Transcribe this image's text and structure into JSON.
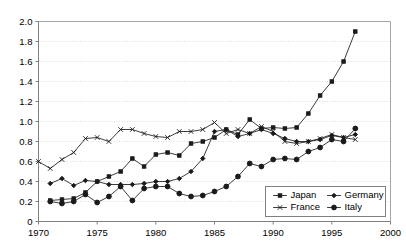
{
  "chart_data": {
    "type": "line",
    "title": "",
    "subtitle": "",
    "xlabel": "",
    "ylabel": "",
    "xlim": [
      1970,
      2000
    ],
    "ylim": [
      0,
      2.0
    ],
    "xticks": [
      "1970",
      "1975",
      "1980",
      "1985",
      "1990",
      "1995",
      "2000"
    ],
    "xtick_values": [
      1970,
      1975,
      1980,
      1985,
      1990,
      1995,
      2000
    ],
    "yticks": [
      "0",
      "0.2",
      "0.4",
      "0.6",
      "0.8",
      "1.0",
      "1.2",
      "1.4",
      "1.6",
      "1.8",
      "2.0"
    ],
    "ytick_values": [
      0,
      0.2,
      0.4,
      0.6,
      0.8,
      1.0,
      1.2,
      1.4,
      1.6,
      1.8,
      2.0
    ],
    "grid": true,
    "grid_axis": "y",
    "legend_position": "bottom-right",
    "series": [
      {
        "name": "Japan",
        "marker": "square",
        "x": [
          1971,
          1972,
          1973,
          1974,
          1975,
          1976,
          1977,
          1978,
          1979,
          1980,
          1981,
          1982,
          1983,
          1984,
          1985,
          1986,
          1987,
          1988,
          1989,
          1990,
          1991,
          1992,
          1993,
          1994,
          1995,
          1996,
          1997
        ],
        "values": [
          0.21,
          0.22,
          0.23,
          0.29,
          0.4,
          0.45,
          0.5,
          0.63,
          0.55,
          0.67,
          0.69,
          0.66,
          0.78,
          0.8,
          0.84,
          0.92,
          0.87,
          1.02,
          0.93,
          0.94,
          0.93,
          0.94,
          1.08,
          1.26,
          1.4,
          1.6,
          1.9
        ]
      },
      {
        "name": "Germany",
        "marker": "diamond",
        "x": [
          1971,
          1972,
          1973,
          1974,
          1975,
          1976,
          1977,
          1978,
          1979,
          1980,
          1981,
          1982,
          1983,
          1984,
          1985,
          1986,
          1987,
          1988,
          1989,
          1990,
          1991,
          1992,
          1993,
          1994,
          1995,
          1996,
          1997
        ],
        "values": [
          0.38,
          0.43,
          0.36,
          0.41,
          0.4,
          0.37,
          0.37,
          0.37,
          0.38,
          0.4,
          0.4,
          0.43,
          0.5,
          0.63,
          0.9,
          0.92,
          0.85,
          0.88,
          0.92,
          0.88,
          0.83,
          0.8,
          0.8,
          0.82,
          0.86,
          0.84,
          0.87
        ]
      },
      {
        "name": "France",
        "marker": "cross",
        "x": [
          1970,
          1971,
          1972,
          1973,
          1974,
          1975,
          1976,
          1977,
          1978,
          1979,
          1980,
          1981,
          1982,
          1983,
          1984,
          1985,
          1986,
          1987,
          1988,
          1989,
          1990,
          1991,
          1992,
          1993,
          1994,
          1995,
          1996,
          1997
        ],
        "values": [
          0.6,
          0.53,
          0.62,
          0.69,
          0.83,
          0.84,
          0.8,
          0.92,
          0.92,
          0.88,
          0.85,
          0.84,
          0.9,
          0.9,
          0.92,
          0.99,
          0.88,
          0.92,
          0.88,
          0.95,
          0.9,
          0.8,
          0.78,
          0.8,
          0.83,
          0.87,
          0.84,
          0.82
        ]
      },
      {
        "name": "Italy",
        "marker": "circle",
        "x": [
          1971,
          1972,
          1973,
          1974,
          1975,
          1976,
          1977,
          1978,
          1979,
          1980,
          1981,
          1982,
          1983,
          1984,
          1985,
          1986,
          1987,
          1988,
          1989,
          1990,
          1991,
          1992,
          1993,
          1994,
          1995,
          1996,
          1997
        ],
        "values": [
          0.2,
          0.18,
          0.2,
          0.27,
          0.19,
          0.25,
          0.35,
          0.21,
          0.33,
          0.35,
          0.35,
          0.28,
          0.25,
          0.26,
          0.3,
          0.35,
          0.45,
          0.58,
          0.55,
          0.62,
          0.63,
          0.62,
          0.7,
          0.74,
          0.82,
          0.8,
          0.93
        ]
      }
    ]
  },
  "legend": {
    "items": [
      {
        "label": "Japan",
        "marker": "square"
      },
      {
        "label": "Germany",
        "marker": "diamond"
      },
      {
        "label": "France",
        "marker": "cross"
      },
      {
        "label": "Italy",
        "marker": "circle"
      }
    ]
  }
}
